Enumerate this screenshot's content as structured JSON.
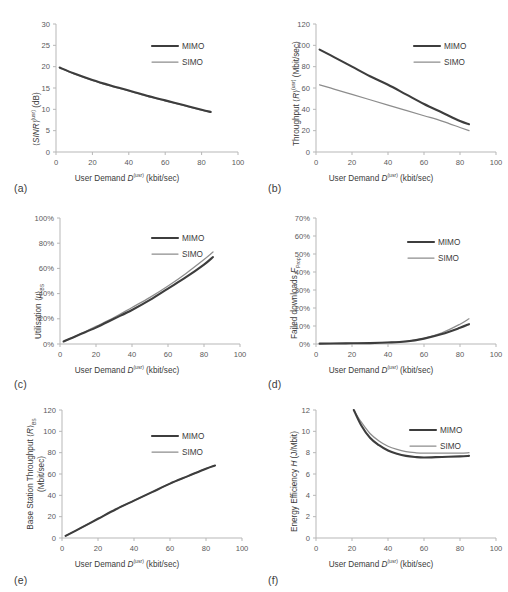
{
  "figure": {
    "panels": [
      "(a)",
      "(b)",
      "(c)",
      "(d)",
      "(e)",
      "(f)"
    ],
    "legend": [
      "MIMO",
      "SIMO"
    ],
    "colors": {
      "mimo": "#3d3d3d",
      "simo": "#8d8d8d",
      "axis": "#b7b7b7",
      "text": "#3b3b3b"
    }
  },
  "chart_data": [
    {
      "panel": "(a)",
      "type": "line",
      "title": "",
      "xlabel": "User Demand D(usr) (kbit/sec)",
      "ylabel": "(SINR)(usr) (dB)",
      "xlim": [
        0,
        100
      ],
      "ylim": [
        0,
        30
      ],
      "xticks": [
        "0",
        "20",
        "40",
        "60",
        "80",
        "100"
      ],
      "yticks": [
        "0",
        "5",
        "10",
        "15",
        "20",
        "25",
        "30"
      ],
      "grid": false,
      "legend_position": "upper-right-inside",
      "x": [
        2,
        10,
        20,
        30,
        40,
        50,
        60,
        70,
        80,
        85
      ],
      "series": [
        {
          "name": "MIMO",
          "values": [
            19.8,
            18.4,
            16.9,
            15.6,
            14.4,
            13.2,
            12.1,
            11.0,
            9.9,
            9.4
          ]
        },
        {
          "name": "SIMO",
          "values": [
            19.7,
            18.3,
            16.8,
            15.5,
            14.3,
            13.1,
            12.0,
            10.9,
            9.8,
            9.3
          ]
        }
      ]
    },
    {
      "panel": "(b)",
      "type": "line",
      "title": "",
      "xlabel": "User Demand D(usr) (kbit/sec)",
      "ylabel": "Throughput (R)(usr) (Mbit/sec)",
      "xlim": [
        0,
        100
      ],
      "ylim": [
        0,
        120
      ],
      "xticks": [
        "0",
        "20",
        "40",
        "60",
        "80",
        "100"
      ],
      "yticks": [
        "0",
        "20",
        "40",
        "60",
        "80",
        "100",
        "120"
      ],
      "grid": false,
      "legend_position": "upper-right-inside",
      "x": [
        2,
        10,
        20,
        30,
        40,
        50,
        60,
        70,
        80,
        85
      ],
      "series": [
        {
          "name": "MIMO",
          "values": [
            96,
            89,
            80,
            71,
            63,
            54,
            45,
            37,
            29,
            26
          ]
        },
        {
          "name": "SIMO",
          "values": [
            63,
            59,
            54,
            49,
            44,
            39,
            34,
            29,
            23,
            20
          ]
        }
      ]
    },
    {
      "panel": "(c)",
      "type": "line",
      "title": "",
      "xlabel": "User Demand D(usr) (kbit/sec)",
      "ylabel": "Utilisation (μ)BS",
      "xlim": [
        0,
        100
      ],
      "ylim": [
        0,
        100
      ],
      "xticks": [
        "0",
        "20",
        "40",
        "60",
        "80",
        "100"
      ],
      "yticks": [
        "0%",
        "20%",
        "40%",
        "60%",
        "80%",
        "100%"
      ],
      "grid": false,
      "legend_position": "upper-right-inside",
      "x": [
        2,
        10,
        20,
        30,
        40,
        50,
        60,
        70,
        80,
        85
      ],
      "series": [
        {
          "name": "MIMO",
          "values": [
            2,
            7,
            13,
            20,
            27,
            35,
            44,
            53,
            63,
            69
          ]
        },
        {
          "name": "SIMO",
          "values": [
            2,
            7,
            14,
            21,
            29,
            37,
            46,
            56,
            67,
            73
          ]
        }
      ]
    },
    {
      "panel": "(d)",
      "type": "line",
      "title": "",
      "xlabel": "User Demand D(usr) (kbit/sec)",
      "ylabel": "Failed downloads FProp",
      "xlim": [
        0,
        100
      ],
      "ylim": [
        0,
        70
      ],
      "xticks": [
        "0",
        "20",
        "40",
        "60",
        "80",
        "100"
      ],
      "yticks": [
        "0%",
        "10%",
        "20%",
        "30%",
        "40%",
        "50%",
        "60%",
        "70%"
      ],
      "grid": false,
      "legend_position": "upper-right-inside",
      "x": [
        2,
        10,
        20,
        30,
        40,
        50,
        60,
        70,
        80,
        85
      ],
      "series": [
        {
          "name": "MIMO",
          "values": [
            0.2,
            0.3,
            0.4,
            0.5,
            0.8,
            1.4,
            3.0,
            5.5,
            9.0,
            11.0
          ]
        },
        {
          "name": "SIMO",
          "values": [
            0.2,
            0.3,
            0.4,
            0.6,
            0.9,
            1.6,
            3.2,
            6.2,
            11.0,
            14.0
          ]
        }
      ]
    },
    {
      "panel": "(e)",
      "type": "line",
      "title": "",
      "xlabel": "User Demand D(usr) (kbit/sec)",
      "ylabel": "Base Station Throughput (R)BS (Mbit/sec)",
      "xlim": [
        0,
        100
      ],
      "ylim": [
        0,
        120
      ],
      "xticks": [
        "0",
        "20",
        "40",
        "60",
        "80",
        "100"
      ],
      "yticks": [
        "0",
        "20",
        "40",
        "60",
        "80",
        "100",
        "120"
      ],
      "grid": false,
      "legend_position": "upper-right-inside",
      "x": [
        2,
        10,
        20,
        30,
        40,
        50,
        60,
        70,
        80,
        85
      ],
      "series": [
        {
          "name": "MIMO",
          "values": [
            2,
            9,
            18,
            27,
            35,
            43,
            51,
            58,
            65,
            68
          ]
        },
        {
          "name": "SIMO",
          "values": [
            2,
            9,
            18,
            27,
            35,
            43,
            51,
            58,
            65,
            68
          ]
        }
      ]
    },
    {
      "panel": "(f)",
      "type": "line",
      "title": "",
      "xlabel": "User Demand D(usr) (kbit/sec)",
      "ylabel": "Energy Efficiency H (J/Mbit)",
      "xlim": [
        0,
        100
      ],
      "ylim": [
        0,
        12
      ],
      "xticks": [
        "0",
        "20",
        "40",
        "60",
        "80",
        "100"
      ],
      "yticks": [
        "0",
        "2",
        "4",
        "6",
        "8",
        "10",
        "12"
      ],
      "grid": false,
      "legend_position": "upper-right-inside",
      "x": [
        21,
        25,
        30,
        35,
        40,
        45,
        50,
        55,
        60,
        70,
        80,
        85
      ],
      "series": [
        {
          "name": "MIMO",
          "values": [
            12.0,
            10.6,
            9.4,
            8.7,
            8.2,
            7.9,
            7.7,
            7.6,
            7.55,
            7.6,
            7.65,
            7.7
          ]
        },
        {
          "name": "SIMO",
          "values": [
            12.0,
            10.9,
            9.8,
            9.1,
            8.6,
            8.3,
            8.1,
            8.0,
            7.95,
            7.95,
            7.95,
            8.0
          ]
        }
      ]
    }
  ]
}
